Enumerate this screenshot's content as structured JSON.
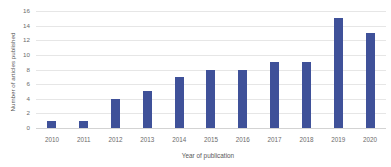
{
  "chart_data": {
    "type": "bar",
    "title": "",
    "categories": [
      "2010",
      "2011",
      "2012",
      "2013",
      "2014",
      "2015",
      "2016",
      "2017",
      "2018",
      "2019",
      "2020"
    ],
    "values": [
      1,
      1,
      4,
      5,
      7,
      8,
      8,
      9,
      9,
      15,
      13
    ],
    "xlabel": "Year of publication",
    "ylabel": "Number of articles published",
    "ylim": [
      0,
      16
    ],
    "ytick_labels": [
      "16",
      "14",
      "12",
      "10",
      "8",
      "6",
      "4",
      "2",
      "0"
    ],
    "ytick_values": [
      16,
      14,
      12,
      10,
      8,
      6,
      4,
      2,
      0
    ],
    "grid": true,
    "legend": "none",
    "series_name": "Number of articles published",
    "bar_color": "#3f5199",
    "gridline_color": "#e6e6e6",
    "axis_color": "#d3d3d3",
    "background_color": "#ffffff",
    "text_color": "#6b6b6b"
  }
}
